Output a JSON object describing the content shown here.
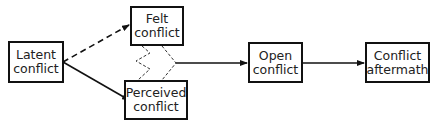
{
  "diagram": {
    "nodes": [
      {
        "id": "latent",
        "label": "Latent\nconflict"
      },
      {
        "id": "felt",
        "label": "Felt\nconflict"
      },
      {
        "id": "perceived",
        "label": "Perceived\nconflict"
      },
      {
        "id": "open",
        "label": "Open\nconflict"
      },
      {
        "id": "aftermath",
        "label": "Conflict\naftermath"
      }
    ],
    "edges": [
      {
        "from": "latent",
        "to": "felt",
        "style": "dashed"
      },
      {
        "from": "latent",
        "to": "perceived",
        "style": "solid"
      },
      {
        "from": "felt",
        "to": "perceived",
        "style": "dashed-zigzag"
      },
      {
        "from": "felt+perceived",
        "to": "open",
        "style": "solid"
      },
      {
        "from": "open",
        "to": "aftermath",
        "style": "solid"
      }
    ]
  }
}
